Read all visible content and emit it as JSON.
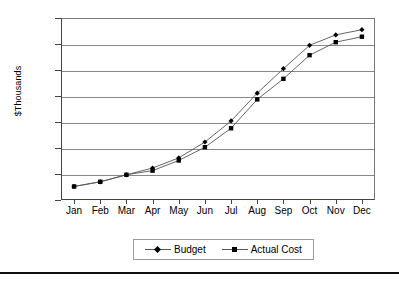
{
  "chart_data": {
    "type": "line",
    "title": "",
    "xlabel": "",
    "ylabel": "$Thousands",
    "categories": [
      "Jan",
      "Feb",
      "Mar",
      "Apr",
      "May",
      "Jun",
      "Jul",
      "Aug",
      "Sep",
      "Oct",
      "Nov",
      "Dec"
    ],
    "ylim": [
      0,
      700
    ],
    "yticks": [
      0,
      100,
      200,
      300,
      400,
      500,
      600,
      700
    ],
    "ytick_labels": [
      "0",
      "100",
      "200",
      "300",
      "400",
      "500",
      "600",
      "700"
    ],
    "grid": true,
    "legend_position": "bottom",
    "series": [
      {
        "name": "Budget",
        "marker": "diamond",
        "color": "#000000",
        "values": [
          52,
          70,
          97,
          123,
          162,
          223,
          304,
          411,
          505,
          595,
          635,
          655
        ]
      },
      {
        "name": "Actual Cost",
        "marker": "square",
        "color": "#000000",
        "values": [
          52,
          70,
          97,
          113,
          152,
          203,
          276,
          387,
          466,
          557,
          607,
          628
        ]
      }
    ]
  },
  "legend": {
    "entries": [
      {
        "label": "Budget",
        "marker": "diamond-marker-icon"
      },
      {
        "label": "Actual Cost",
        "marker": "square-marker-icon"
      }
    ]
  }
}
